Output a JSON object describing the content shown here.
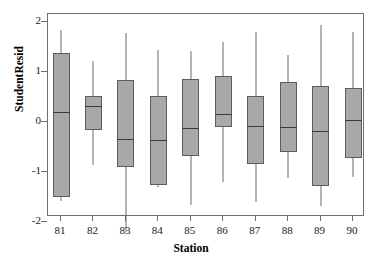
{
  "chart_data": {
    "type": "box",
    "title": "",
    "xlabel": "Station",
    "ylabel": "StudentResid",
    "xlim": [
      80.5,
      90.5
    ],
    "ylim": [
      -2.35,
      2.2
    ],
    "grid": false,
    "legend": null,
    "y_ticks": [
      2,
      1,
      0,
      -1,
      -2
    ],
    "y_tick_labels": [
      "2",
      "1",
      "0",
      "-1",
      "-2"
    ],
    "categories": [
      "81",
      "82",
      "83",
      "84",
      "85",
      "86",
      "87",
      "88",
      "89",
      "90"
    ],
    "box_color": "#a8a8a8",
    "box_edge_color": "#5d5d5d",
    "whisker_color": "#6b6b6b",
    "median_color": "#3a3a3a",
    "boxes": [
      {
        "category": "81",
        "whisker_low": -1.58,
        "q1": -1.5,
        "median": 0.2,
        "q3": 1.38,
        "whisker_high": 1.85
      },
      {
        "category": "82",
        "whisker_low": -0.85,
        "q1": -0.15,
        "median": 0.33,
        "q3": 0.52,
        "whisker_high": 1.22
      },
      {
        "category": "83",
        "whisker_low": -2.2,
        "q1": -0.9,
        "median": -0.34,
        "q3": 0.84,
        "whisker_high": 1.78
      },
      {
        "category": "84",
        "whisker_low": -1.3,
        "q1": -1.25,
        "median": -0.36,
        "q3": 0.52,
        "whisker_high": 1.44
      },
      {
        "category": "85",
        "whisker_low": -1.65,
        "q1": -0.68,
        "median": -0.12,
        "q3": 0.86,
        "whisker_high": 1.42
      },
      {
        "category": "86",
        "whisker_low": -1.2,
        "q1": -0.1,
        "median": 0.17,
        "q3": 0.93,
        "whisker_high": 1.6
      },
      {
        "category": "87",
        "whisker_low": -1.6,
        "q1": -0.84,
        "median": -0.08,
        "q3": 0.52,
        "whisker_high": 1.8
      },
      {
        "category": "88",
        "whisker_low": -1.12,
        "q1": -0.6,
        "median": -0.1,
        "q3": 0.8,
        "whisker_high": 1.34
      },
      {
        "category": "89",
        "whisker_low": -1.68,
        "q1": -1.28,
        "median": -0.18,
        "q3": 0.72,
        "whisker_high": 1.95
      },
      {
        "category": "90",
        "whisker_low": -1.1,
        "q1": -0.72,
        "median": 0.04,
        "q3": 0.68,
        "whisker_high": 1.8
      }
    ]
  }
}
